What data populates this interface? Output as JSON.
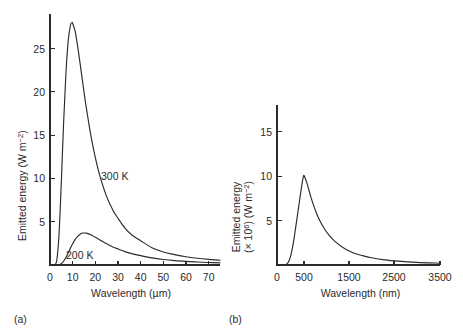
{
  "figure": {
    "panels": [
      {
        "caption": "(a)",
        "xlabel": "Wavelength (µm)",
        "ylabel_main": "Emitted energy (W m",
        "ylabel_exp": "−2",
        "ylabel_tail": ")",
        "xticks": [
          "0",
          "10",
          "20",
          "30",
          "40",
          "50",
          "60",
          "70"
        ],
        "yticks": [
          "5",
          "10",
          "15",
          "20",
          "25"
        ],
        "curve_labels": [
          "300 K",
          "200 K"
        ]
      },
      {
        "caption": "(b)",
        "xlabel": "Wavelength (nm)",
        "ylabel_line1_a": "Emitted energy",
        "ylabel_line2_a": "(× 10",
        "ylabel_line2_exp1": "6",
        "ylabel_line2_b": ") (W m",
        "ylabel_line2_exp2": "−2",
        "ylabel_line2_c": ")",
        "xticks": [
          "0",
          "500",
          "1500",
          "2500",
          "3500"
        ],
        "yticks": [
          "5",
          "10",
          "15"
        ]
      }
    ]
  },
  "chart_data": [
    {
      "type": "line",
      "title": "",
      "panel": "(a)",
      "xlabel": "Wavelength (µm)",
      "ylabel": "Emitted energy (W m⁻²)",
      "xlim": [
        0,
        75
      ],
      "ylim": [
        0,
        29
      ],
      "xticks": [
        0,
        10,
        20,
        30,
        40,
        50,
        60,
        70
      ],
      "yticks": [
        5,
        10,
        15,
        20,
        25
      ],
      "grid": false,
      "legend_position": "inline-annotation",
      "series": [
        {
          "name": "300 K",
          "peak_x": 9.7,
          "peak_y": 28.0,
          "x": [
            2,
            3,
            4,
            5,
            6,
            7,
            8,
            9,
            9.7,
            10,
            11,
            12,
            13,
            14,
            15,
            16,
            18,
            20,
            22,
            25,
            28,
            30,
            33,
            36,
            40,
            45,
            50,
            55,
            60,
            65,
            70,
            75
          ],
          "y": [
            0.02,
            0.55,
            3.6,
            9.6,
            16.4,
            22.0,
            25.8,
            27.7,
            28.0,
            27.9,
            27.1,
            25.6,
            23.8,
            21.9,
            20.0,
            18.2,
            15.0,
            12.4,
            10.3,
            7.9,
            6.2,
            5.4,
            4.3,
            3.5,
            2.8,
            2.0,
            1.5,
            1.2,
            0.95,
            0.78,
            0.65,
            0.55
          ]
        },
        {
          "name": "200 K",
          "peak_x": 14.5,
          "peak_y": 3.7,
          "x": [
            3,
            4,
            5,
            6,
            7,
            8,
            9,
            10,
            11,
            12,
            13,
            14,
            14.5,
            15,
            16,
            18,
            20,
            22,
            25,
            28,
            30,
            33,
            36,
            40,
            45,
            50,
            55,
            60,
            65,
            70,
            75
          ],
          "y": [
            0.0,
            0.03,
            0.15,
            0.43,
            0.86,
            1.4,
            1.95,
            2.45,
            2.9,
            3.25,
            3.5,
            3.66,
            3.7,
            3.7,
            3.68,
            3.5,
            3.2,
            2.9,
            2.45,
            2.05,
            1.85,
            1.55,
            1.32,
            1.08,
            0.82,
            0.64,
            0.51,
            0.42,
            0.35,
            0.29,
            0.25
          ]
        }
      ]
    },
    {
      "type": "line",
      "title": "",
      "panel": "(b)",
      "xlabel": "Wavelength (nm)",
      "ylabel": "Emitted energy (× 10⁶) (W m⁻²)",
      "xlim": [
        0,
        3500
      ],
      "ylim": [
        0,
        18
      ],
      "xticks": [
        0,
        500,
        1500,
        2500,
        3500
      ],
      "yticks": [
        5,
        10,
        15
      ],
      "grid": false,
      "legend_position": "none",
      "series": [
        {
          "name": "6000 K",
          "peak_x": 490,
          "peak_y": 10.0,
          "x": [
            150,
            200,
            250,
            300,
            350,
            400,
            450,
            490,
            520,
            560,
            600,
            650,
            700,
            780,
            850,
            950,
            1050,
            1200,
            1400,
            1600,
            1800,
            2000,
            2300,
            2600,
            3000,
            3500
          ],
          "y": [
            0.02,
            0.22,
            0.95,
            2.4,
            4.4,
            6.5,
            8.6,
            10.0,
            9.85,
            9.3,
            8.6,
            7.7,
            6.9,
            5.8,
            5.0,
            4.1,
            3.4,
            2.6,
            1.85,
            1.35,
            1.05,
            0.82,
            0.58,
            0.43,
            0.3,
            0.2
          ]
        }
      ]
    }
  ]
}
